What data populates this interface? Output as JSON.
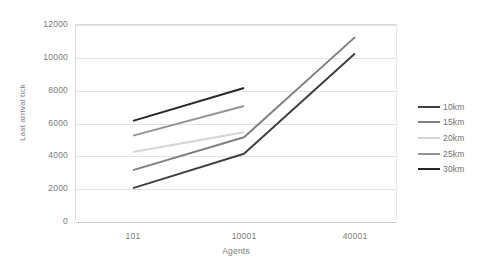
{
  "chart_data": {
    "type": "line",
    "title": "",
    "xlabel": "Agents",
    "ylabel": "Last arrival tick",
    "categories": [
      "101",
      "10001",
      "40001"
    ],
    "x_tick_labels": [
      "101",
      "10001",
      "40001"
    ],
    "y_tick_labels": [
      "0",
      "2000",
      "4000",
      "6000",
      "8000",
      "10000",
      "12000"
    ],
    "ylim": [
      0,
      12000
    ],
    "y_tick_step": 2000,
    "grid": "horizontal",
    "legend_position": "right",
    "series": [
      {
        "name": "10km",
        "color": "#404040",
        "values": [
          2000,
          4100,
          10200
        ]
      },
      {
        "name": "15km",
        "color": "#7f7f7f",
        "values": [
          3100,
          5100,
          11200
        ]
      },
      {
        "name": "20km",
        "color": "#d4d4d4",
        "values": [
          4200,
          5400,
          null
        ]
      },
      {
        "name": "25km",
        "color": "#949494",
        "values": [
          5200,
          7000,
          null
        ]
      },
      {
        "name": "30km",
        "color": "#262626",
        "values": [
          6100,
          8100,
          null
        ]
      }
    ]
  },
  "legend": {
    "items": [
      {
        "label": "10km",
        "color": "#404040"
      },
      {
        "label": "15km",
        "color": "#7f7f7f"
      },
      {
        "label": "20km",
        "color": "#d4d4d4"
      },
      {
        "label": "25km",
        "color": "#949494"
      },
      {
        "label": "30km",
        "color": "#262626"
      }
    ]
  },
  "axes": {
    "x_title": "Agents",
    "y_title": "Last arrival tick"
  }
}
